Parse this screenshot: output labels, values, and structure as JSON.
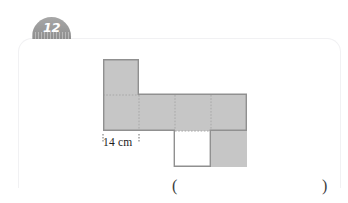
{
  "question": {
    "number": "12"
  },
  "figure": {
    "name": "cube-net",
    "fill_color": "#c6c6c6",
    "outline_color": "#909090",
    "fold_line_color": "#a8a8a8",
    "cell_size_px": 36,
    "cells": [
      {
        "name": "net-cell-top",
        "col": 0,
        "row": 0
      },
      {
        "name": "net-cell-middle-left",
        "col": 0,
        "row": 1
      },
      {
        "name": "net-cell-middle-2",
        "col": 1,
        "row": 1
      },
      {
        "name": "net-cell-middle-3",
        "col": 2,
        "row": 1
      },
      {
        "name": "net-cell-middle-right",
        "col": 3,
        "row": 1
      },
      {
        "name": "net-cell-bottom",
        "col": 3,
        "row": 2
      }
    ],
    "outline_path": "M 0 0 L 36 0 L 36 36 L 144 36 L 144 72 L 108 72 L 108 108 L 72 108 L 72 72 L 0 72 Z",
    "fold_segments": [
      {
        "x1": 0,
        "y1": 36,
        "x2": 36,
        "y2": 36
      },
      {
        "x1": 36,
        "y1": 36,
        "x2": 36,
        "y2": 72
      },
      {
        "x1": 72,
        "y1": 36,
        "x2": 72,
        "y2": 72
      },
      {
        "x1": 108,
        "y1": 36,
        "x2": 108,
        "y2": 72
      },
      {
        "x1": 72,
        "y1": 72,
        "x2": 108,
        "y2": 72
      }
    ]
  },
  "measurement": {
    "label": "14 cm",
    "badge_text_color": "#ffffff",
    "tick_color": "#5b5b5b"
  },
  "answer": {
    "paren_left": "(",
    "paren_right": ")"
  },
  "panel": {
    "border_color": "#f1f1f3"
  }
}
